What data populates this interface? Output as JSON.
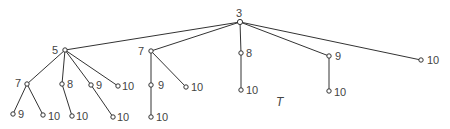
{
  "tree_label": "T",
  "nodes": [
    {
      "id": "r",
      "label": "3",
      "x": 240,
      "y": 22,
      "lx": 236,
      "ly": 7,
      "parent": null
    },
    {
      "id": "a",
      "label": "5",
      "x": 65,
      "y": 50,
      "lx": 52,
      "ly": 44,
      "parent": "r"
    },
    {
      "id": "b",
      "label": "7",
      "x": 151,
      "y": 51,
      "lx": 138,
      "ly": 45,
      "parent": "r"
    },
    {
      "id": "c",
      "label": "8",
      "x": 241,
      "y": 53,
      "lx": 246,
      "ly": 47,
      "parent": "r"
    },
    {
      "id": "d",
      "label": "9",
      "x": 329,
      "y": 56,
      "lx": 335,
      "ly": 50,
      "parent": "r"
    },
    {
      "id": "e",
      "label": "10",
      "x": 421,
      "y": 60,
      "lx": 427,
      "ly": 54,
      "parent": "r"
    },
    {
      "id": "a1",
      "label": "7",
      "x": 27,
      "y": 84,
      "lx": 15,
      "ly": 77,
      "parent": "a"
    },
    {
      "id": "a2",
      "label": "8",
      "x": 62,
      "y": 84,
      "lx": 67,
      "ly": 78,
      "parent": "a"
    },
    {
      "id": "a3",
      "label": "9",
      "x": 91,
      "y": 85,
      "lx": 96,
      "ly": 79,
      "parent": "a"
    },
    {
      "id": "a4",
      "label": "10",
      "x": 118,
      "y": 86,
      "lx": 122,
      "ly": 80,
      "parent": "a"
    },
    {
      "id": "a1a",
      "label": "9",
      "x": 13,
      "y": 114,
      "lx": 18,
      "ly": 108,
      "parent": "a1"
    },
    {
      "id": "a1b",
      "label": "10",
      "x": 43,
      "y": 115,
      "lx": 48,
      "ly": 110,
      "parent": "a1"
    },
    {
      "id": "a2a",
      "label": "10",
      "x": 72,
      "y": 116,
      "lx": 76,
      "ly": 110,
      "parent": "a2"
    },
    {
      "id": "a3a",
      "label": "10",
      "x": 113,
      "y": 117,
      "lx": 117,
      "ly": 111,
      "parent": "a3"
    },
    {
      "id": "b1",
      "label": "9",
      "x": 151,
      "y": 85,
      "lx": 158,
      "ly": 79,
      "parent": "b"
    },
    {
      "id": "b2",
      "label": "10",
      "x": 186,
      "y": 87,
      "lx": 191,
      "ly": 81,
      "parent": "b"
    },
    {
      "id": "b1a",
      "label": "10",
      "x": 151,
      "y": 117,
      "lx": 156,
      "ly": 111,
      "parent": "b1"
    },
    {
      "id": "c1",
      "label": "10",
      "x": 241,
      "y": 90,
      "lx": 246,
      "ly": 84,
      "parent": "c"
    },
    {
      "id": "d1",
      "label": "10",
      "x": 329,
      "y": 91,
      "lx": 334,
      "ly": 86,
      "parent": "d"
    }
  ],
  "tree_label_pos": {
    "x": 276,
    "y": 96
  }
}
